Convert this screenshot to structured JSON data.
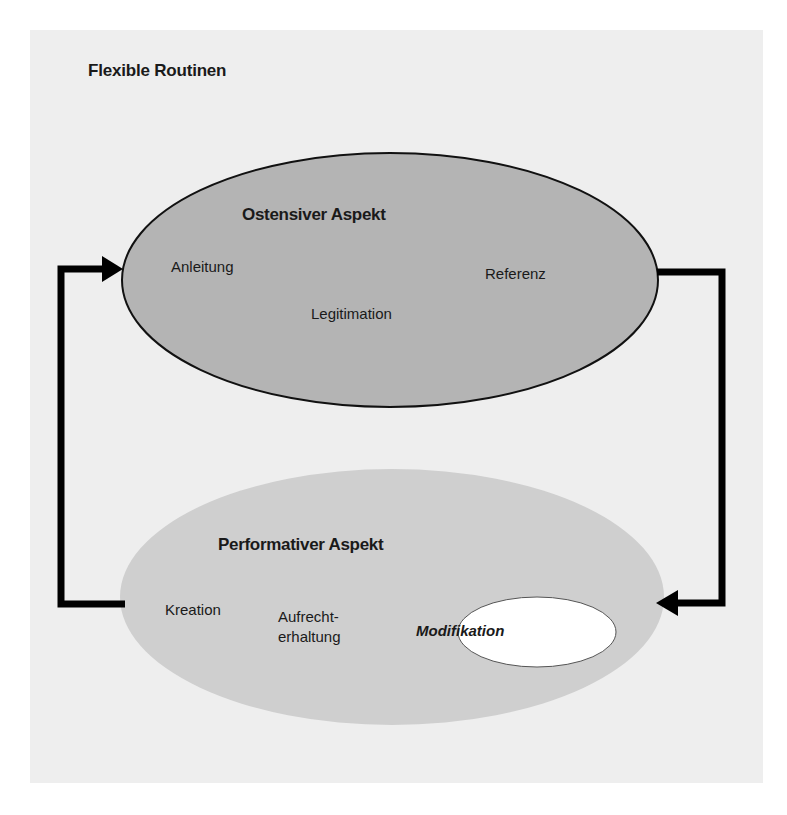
{
  "title": "Flexible Routinen",
  "ostensive": {
    "heading": "Ostensiver Aspekt",
    "items": [
      "Anleitung",
      "Legitimation",
      "Referenz"
    ],
    "fill": "#b4b4b4"
  },
  "performative": {
    "heading": "Performativer Aspekt",
    "items": [
      "Kreation",
      "Aufrecht-",
      "erhaltung"
    ],
    "highlight": "Modifikation",
    "fill": "#cfcfcf"
  },
  "colors": {
    "background": "#eeeeee",
    "arrow": "#000000",
    "highlight_fill": "#ffffff"
  }
}
